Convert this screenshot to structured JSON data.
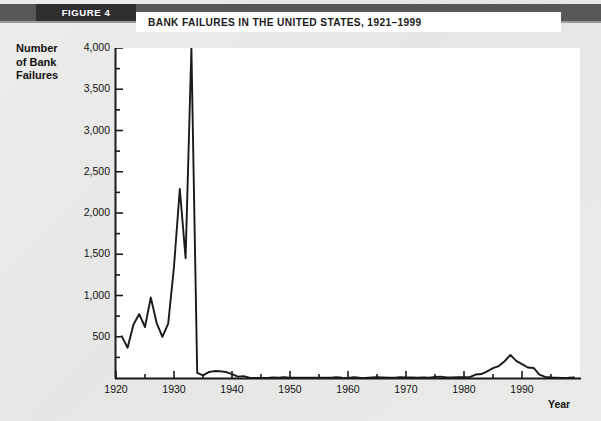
{
  "figure": {
    "tag": "FIGURE 4",
    "title": "BANK FAILURES IN THE UNITED STATES, 1921–1999"
  },
  "colors": {
    "page_background": "#e9e9e7",
    "header_band": "#58585a",
    "figure_tag_background": "#2f2f31",
    "title_plate_background": "#ffffff",
    "plot_background": "#ffffff",
    "line": "#1a1a1a",
    "axis": "#1a1a1a",
    "text": "#111111"
  },
  "axes": {
    "y_title_lines": [
      "Number",
      "of Bank",
      "Failures"
    ],
    "x_title": "Year",
    "y_ticks": [
      "4,000",
      "3,500",
      "3,000",
      "2,500",
      "2,000",
      "1,500",
      "1,000",
      "500"
    ],
    "y_tick_values": [
      4000,
      3500,
      3000,
      2500,
      2000,
      1500,
      1000,
      500
    ],
    "x_ticks": [
      "1920",
      "1930",
      "1940",
      "1950",
      "1960",
      "1970",
      "1980",
      "1990"
    ],
    "x_tick_values": [
      1920,
      1930,
      1940,
      1950,
      1960,
      1970,
      1980,
      1990
    ]
  },
  "chart_data": {
    "type": "line",
    "title": "BANK FAILURES IN THE UNITED STATES, 1921–1999",
    "xlabel": "Year",
    "ylabel": "Number of Bank Failures",
    "xlim": [
      1920,
      2000
    ],
    "ylim": [
      0,
      4000
    ],
    "grid": false,
    "legend": null,
    "series": [
      {
        "name": "Bank failures",
        "x": [
          1921,
          1922,
          1923,
          1924,
          1925,
          1926,
          1927,
          1928,
          1929,
          1930,
          1931,
          1932,
          1933,
          1934,
          1935,
          1936,
          1937,
          1938,
          1939,
          1940,
          1941,
          1942,
          1943,
          1944,
          1945,
          1946,
          1947,
          1948,
          1949,
          1950,
          1951,
          1952,
          1953,
          1954,
          1955,
          1956,
          1957,
          1958,
          1959,
          1960,
          1961,
          1962,
          1963,
          1964,
          1965,
          1966,
          1967,
          1968,
          1969,
          1970,
          1971,
          1972,
          1973,
          1974,
          1975,
          1976,
          1977,
          1978,
          1979,
          1980,
          1981,
          1982,
          1983,
          1984,
          1985,
          1986,
          1987,
          1988,
          1989,
          1990,
          1991,
          1992,
          1993,
          1994,
          1995,
          1996,
          1997,
          1998,
          1999
        ],
        "values": [
          505,
          367,
          646,
          775,
          618,
          976,
          669,
          499,
          659,
          1350,
          2293,
          1453,
          4000,
          61,
          32,
          72,
          84,
          81,
          72,
          48,
          17,
          23,
          5,
          2,
          1,
          2,
          6,
          3,
          9,
          5,
          5,
          4,
          5,
          4,
          5,
          3,
          3,
          9,
          3,
          2,
          9,
          3,
          2,
          8,
          9,
          8,
          4,
          3,
          9,
          8,
          6,
          3,
          6,
          4,
          14,
          17,
          6,
          7,
          10,
          11,
          10,
          42,
          48,
          80,
          120,
          145,
          203,
          280,
          207,
          169,
          127,
          122,
          41,
          13,
          6,
          5,
          1,
          3,
          8
        ]
      }
    ],
    "annotations": [
      {
        "text": "1933 peak exceeds chart top (4,000)",
        "x": 1933,
        "y": 4000
      }
    ]
  }
}
